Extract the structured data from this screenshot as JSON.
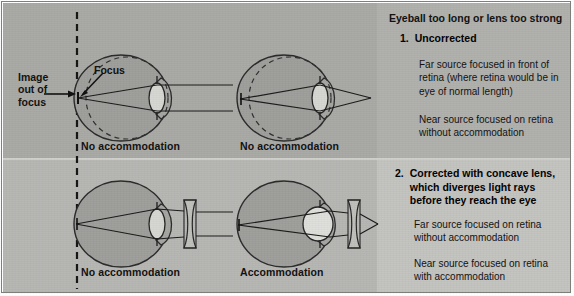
{
  "figure": {
    "title": "Eyeball too long or lens too strong",
    "condition": "Myopia (nearsightedness)"
  },
  "callouts": {
    "image_out_of_focus": "Image\nout of\nfocus",
    "image_out_of_focus_line1": "Image",
    "image_out_of_focus_line2": "out of",
    "image_out_of_focus_line3": "focus",
    "focus": "Focus"
  },
  "diagram_labels": {
    "top_left": "No accommodation",
    "top_right": "No accommodation",
    "bottom_left": "No accommodation",
    "bottom_right": "Accommodation"
  },
  "right_panel": {
    "sections": [
      {
        "number": "1.",
        "heading": "Uncorrected",
        "paragraphs": [
          "Far source focused in front of retina (where retina would be in eye of normal length)",
          "Near source focused on retina without accommodation"
        ]
      },
      {
        "number": "2.",
        "heading": "Corrected with concave lens, which diverges light rays before they reach the eye",
        "paragraphs": [
          "Far source focused on retina without accommodation",
          "Near source focused on retina with accommodation"
        ]
      }
    ]
  },
  "colors": {
    "panel_top_left": "#a9a9a6",
    "panel_bottom_left": "#b6b6b3",
    "panel_top_right": "#b0b0ad",
    "panel_bottom_right": "#c3c3c0",
    "eye_fill": "#9b9b98",
    "ink": "#1a1a1a",
    "dashed_line": "#141414"
  },
  "diagram_data": {
    "type": "optical-ray-diagram",
    "panels": [
      {
        "id": "top-left",
        "eye": "elongated-myopic",
        "normal_eye_outline": "dashed-inner-circle",
        "source": "far",
        "incoming_rays": "parallel",
        "lens_shape": "relaxed-thin",
        "focal_point": "in front of retina (at normal-length retina plane)",
        "accommodation": false,
        "corrective_lens": null,
        "label": "No accommodation"
      },
      {
        "id": "top-right",
        "eye": "elongated-myopic",
        "normal_eye_outline": "dashed-inner-circle",
        "source": "near",
        "incoming_rays": "diverging",
        "lens_shape": "relaxed-thin",
        "focal_point": "on retina",
        "accommodation": false,
        "corrective_lens": null,
        "label": "No accommodation"
      },
      {
        "id": "bottom-left",
        "eye": "elongated-myopic",
        "normal_eye_outline": null,
        "source": "far",
        "incoming_rays": "parallel",
        "lens_shape": "relaxed-thin",
        "focal_point": "on retina",
        "accommodation": false,
        "corrective_lens": "concave (diverging)",
        "label": "No accommodation"
      },
      {
        "id": "bottom-right",
        "eye": "elongated-myopic",
        "normal_eye_outline": null,
        "source": "near",
        "incoming_rays": "diverging",
        "lens_shape": "accommodated-round",
        "focal_point": "on retina",
        "accommodation": true,
        "corrective_lens": "concave (diverging)",
        "label": "Accommodation"
      }
    ],
    "reference_line": "vertical dashed line marking normal-length retina plane"
  }
}
